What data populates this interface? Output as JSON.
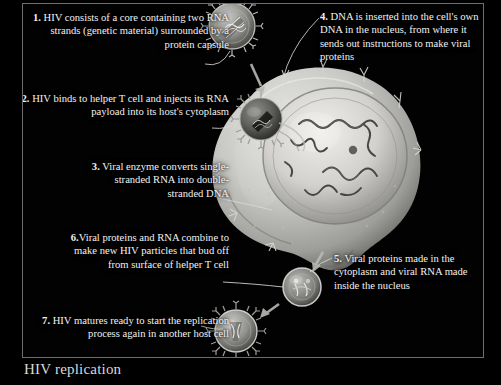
{
  "figure": {
    "caption": "HIV replication",
    "brand": "",
    "frame_color": "#6e6e6e",
    "background": "#000000",
    "text_color": "#f2f2f2"
  },
  "steps": [
    {
      "number": "1.",
      "text": " HIV consists of a core containing two RNA strands (genetic material) surrounded by a protein capsule",
      "align": "right",
      "target": "free-virion"
    },
    {
      "number": "2.",
      "text": " HIV binds to helper T cell and injects its RNA payload into its host's cytoplasm",
      "align": "right",
      "target": "binding-virion"
    },
    {
      "number": "3.",
      "text": " Viral enzyme converts single-stranded RNA into double-stranded DNA",
      "align": "right",
      "target": "cytoplasm"
    },
    {
      "number": "4.",
      "text": " DNA is inserted into the cell's own DNA in the nucleus, from where it sends out instructions to make viral proteins",
      "align": "left",
      "target": "nucleus"
    },
    {
      "number": "5.",
      "text": " Viral proteins made in the cytoplasm and viral RNA made inside the nucleus",
      "align": "left",
      "target": "cytoplasm-proteins"
    },
    {
      "number": "6.",
      "text": "Viral proteins and RNA combine to make new HIV particles that bud off from surface of helper T cell",
      "align": "right",
      "target": "budding-virion"
    },
    {
      "number": "7.",
      "text": " HIV matures ready to start the replication process again in another host cell",
      "align": "right",
      "target": "mature-virion"
    }
  ],
  "artwork": {
    "free_virion_label": "hiv-virion",
    "binding_virion_label": "hiv-virion-binding",
    "budding_virion_label": "hiv-virion-budding",
    "mature_virion_label": "hiv-virion-mature",
    "cell_label": "helper-t-cell",
    "nucleus_label": "cell-nucleus",
    "dna_label": "dna-strands"
  }
}
